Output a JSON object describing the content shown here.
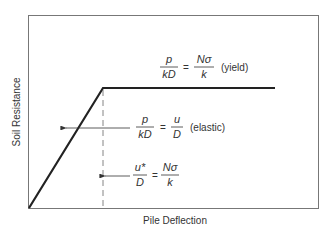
{
  "diagram": {
    "ylabel": "Soil Resistance",
    "xlabel": "Pile Deflection",
    "yield_eq": {
      "lhs_num": "p",
      "lhs_den": "kD",
      "eq": "=",
      "rhs_num": "Nσ",
      "rhs_den": "k",
      "note": "(yield)"
    },
    "elastic_eq": {
      "lhs_num": "p",
      "lhs_den": "kD",
      "eq": "=",
      "rhs_num": "u",
      "rhs_den": "D",
      "note": "(elastic)"
    },
    "deflection_eq": {
      "lhs_num": "u*",
      "lhs_den": "D",
      "eq": "=",
      "rhs_num": "Nσ",
      "rhs_den": "k"
    },
    "colors": {
      "frame": "#777777",
      "curve": "#222222",
      "text": "#333333"
    }
  }
}
